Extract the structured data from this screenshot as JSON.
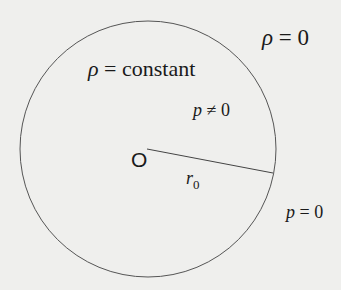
{
  "diagram": {
    "outside_density": {
      "symbol": "ρ",
      "text": " = 0"
    },
    "inside_density": {
      "symbol": "ρ",
      "text": " = constant"
    },
    "inside_pressure": {
      "symbol": "p",
      "text": " ≠ 0"
    },
    "center_label": "O",
    "radius_label": {
      "symbol": "r",
      "subscript": "0"
    },
    "surface_pressure": {
      "symbol": "p",
      "text": " = 0"
    },
    "colors": {
      "background": "#efefed",
      "stroke": "#555555",
      "text": "#1a1a1a"
    }
  }
}
